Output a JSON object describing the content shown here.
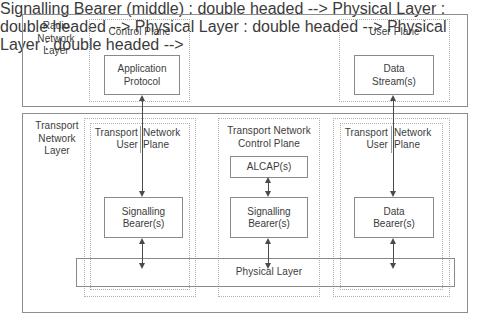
{
  "diagram": {
    "title_present": false,
    "layers": [
      {
        "id": "radio-network-layer",
        "label": "Radio\nNetwork\nLayer"
      },
      {
        "id": "transport-network-layer",
        "label": "Transport\nNetwork\nLayer"
      }
    ],
    "planes": [
      {
        "id": "control-plane",
        "label": "Control Plane"
      },
      {
        "id": "user-plane",
        "label": "User Plane"
      },
      {
        "id": "transport-network-control-plane",
        "label": "Transport Network\nControl Plane"
      }
    ],
    "sub_planes": [
      {
        "id": "transport-user-left",
        "label": "Transport\nUser"
      },
      {
        "id": "network-plane-left",
        "label": "Network\nPlane"
      },
      {
        "id": "transport-user-right",
        "label": "Transport\nUser"
      },
      {
        "id": "network-plane-right",
        "label": "Network\nPlane"
      }
    ],
    "blocks": [
      {
        "id": "application-protocol",
        "label": "Application\nProtocol"
      },
      {
        "id": "data-stream",
        "label": "Data\nStream(s)"
      },
      {
        "id": "alcap",
        "label": "ALCAP(s)"
      },
      {
        "id": "signalling-bearer-left",
        "label": "Signalling\nBearer(s)"
      },
      {
        "id": "signalling-bearer-middle",
        "label": "Signalling\nBearer(s)"
      },
      {
        "id": "data-bearer",
        "label": "Data\nBearer(s)"
      },
      {
        "id": "physical-layer",
        "label": "Physical Layer"
      }
    ],
    "colors": {
      "stroke_solid": "#8a8a8a",
      "stroke_dotted": "#b0b0b0",
      "arrow": "#4a4a4a",
      "text": "#3c3c3c",
      "background": "#ffffff"
    }
  }
}
